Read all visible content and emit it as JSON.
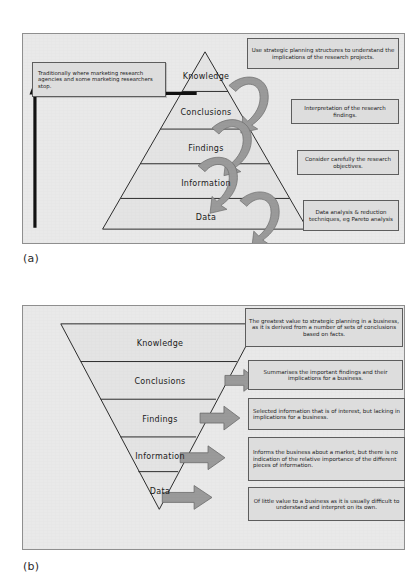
{
  "figure": {
    "panel_a_caption": "(a)",
    "panel_b_caption": "(b)"
  },
  "colors": {
    "panel_background": "#e9e9e9",
    "note_background": "#dddddd",
    "note_border": "#5d5d5d",
    "arrow_fill": "#9a9a9a",
    "arrow_stroke": "#6b6b6b",
    "line": "#2b2b2b",
    "black_arrow": "#111111"
  },
  "panel_a": {
    "pyramid": {
      "orientation": "upright",
      "tiers": [
        {
          "label": "Knowledge"
        },
        {
          "label": "Conclusions"
        },
        {
          "label": "Findings"
        },
        {
          "label": "Information"
        },
        {
          "label": "Data"
        }
      ]
    },
    "left_callout": "Traditionally where marketing research agencies and some marketing researchers stop.",
    "notes": [
      "Use strategic planning structures to understand the implications of the research projects.",
      "Interpretation of the research findings.",
      "Consider carefully the research objectives.",
      "Data analysis & reduction techniques, eg Pareto analysis"
    ],
    "curved_arrow_count": 4,
    "black_arrow_direction": "up"
  },
  "panel_b": {
    "pyramid": {
      "orientation": "inverted",
      "tiers": [
        {
          "label": "Knowledge"
        },
        {
          "label": "Conclusions"
        },
        {
          "label": "Findings"
        },
        {
          "label": "Information"
        },
        {
          "label": "Data"
        }
      ]
    },
    "notes": [
      "The greatest value to strategic planning in a business, as it is derived from a number of sets of conclusions based on facts.",
      "Summarises the important findings and their implications for a business.",
      "Selected information that is of interest, but lacking in implications for a business.",
      "Informs the business about a market, but there is no indication of the relative importance of the different pieces of information.",
      "Of little value to a business as it is usually difficult to understand and interpret on its own."
    ],
    "block_arrow_count": 4
  }
}
